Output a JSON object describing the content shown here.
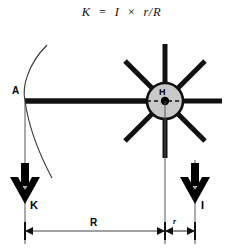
{
  "figure": {
    "title_formula": "K  =  I  ×  r/R",
    "labels": {
      "point_a": "A",
      "hub": "H",
      "force_left": "K",
      "force_right": "I",
      "dimension_large": "R",
      "dimension_small": "r"
    },
    "colors": {
      "stroke": "#111111",
      "hub_fill": "#c9c9c9",
      "background": "#ffffff",
      "thin_line": "#444444"
    },
    "geometry": {
      "hub_center_x": 165,
      "hub_center_y": 101,
      "hub_radius": 18,
      "spoke_count": 8,
      "spoke_length": 57,
      "rim_point_a_x": 25,
      "rim_point_a_y": 101,
      "dimension_line_y": 230,
      "dimension_left_x": 25,
      "dimension_mid_x": 165,
      "dimension_right_x": 195
    }
  }
}
